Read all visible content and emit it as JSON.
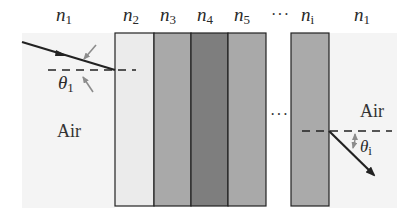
{
  "figure": {
    "type": "multilayer refraction diagram",
    "labels": {
      "left_medium": {
        "symbol": "n",
        "sub": "1"
      },
      "layers": [
        {
          "symbol": "n",
          "sub": "2",
          "fill": "#ebebeb"
        },
        {
          "symbol": "n",
          "sub": "3",
          "fill": "#a9a9a9"
        },
        {
          "symbol": "n",
          "sub": "4",
          "fill": "#7e7e7e"
        },
        {
          "symbol": "n",
          "sub": "5",
          "fill": "#a9a9a9"
        },
        {
          "symbol": "n",
          "sub": "i",
          "fill": "#aaaaaa"
        }
      ],
      "right_medium": {
        "symbol": "n",
        "sub": "1"
      },
      "ellipsis_top": "···",
      "ellipsis_mid": "···",
      "air_left": "Air",
      "air_right": "Air",
      "theta_in": {
        "symbol": "θ",
        "sub": "1"
      },
      "theta_out": {
        "symbol": "θ",
        "sub": "i"
      }
    },
    "colors": {
      "background_medium": "#f4f4f4",
      "outline": "#222222",
      "ray": "#222222",
      "angle_marker": "#8c8c8c"
    }
  }
}
